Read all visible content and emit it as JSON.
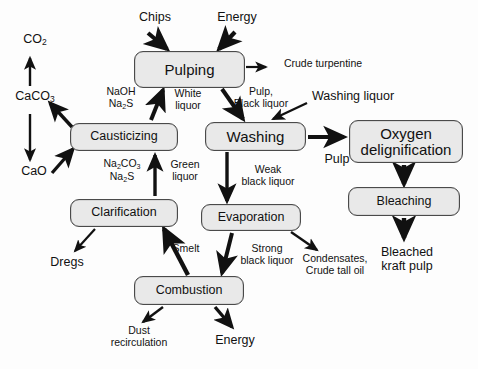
{
  "diagram": {
    "style": {
      "node_fill": "#e9e9e9",
      "node_border": "#4a4a4a",
      "arrow_color": "#111111",
      "background": "#fdfdfd"
    },
    "nodes": [
      {
        "id": "pulping",
        "label": "Pulping",
        "x": 134,
        "y": 51,
        "w": 111,
        "h": 37,
        "font": "big"
      },
      {
        "id": "causticizing",
        "label": "Causticizing",
        "x": 70,
        "y": 123,
        "w": 108,
        "h": 28,
        "font": "mid"
      },
      {
        "id": "washing",
        "label": "Washing",
        "x": 205,
        "y": 122,
        "w": 101,
        "h": 29,
        "font": "big"
      },
      {
        "id": "oxygen",
        "label": "Oxygen\ndelignification",
        "x": 349,
        "y": 120,
        "w": 114,
        "h": 43,
        "font": "big"
      },
      {
        "id": "clarification",
        "label": "Clarification",
        "x": 70,
        "y": 199,
        "w": 108,
        "h": 28,
        "font": "mid"
      },
      {
        "id": "evaporation",
        "label": "Evaporation",
        "x": 201,
        "y": 204,
        "w": 100,
        "h": 27,
        "font": "mid"
      },
      {
        "id": "bleaching",
        "label": "Bleaching",
        "x": 348,
        "y": 187,
        "w": 112,
        "h": 29,
        "font": "mid"
      },
      {
        "id": "combustion",
        "label": "Combustion",
        "x": 134,
        "y": 276,
        "w": 110,
        "h": 29,
        "font": "mid"
      }
    ],
    "labels": [
      {
        "id": "chips",
        "text": "Chips",
        "x": 127,
        "y": 10,
        "w": 56,
        "font": "mid"
      },
      {
        "id": "energy-top",
        "text": "Energy",
        "x": 206,
        "y": 10,
        "w": 62,
        "font": "mid"
      },
      {
        "id": "co2",
        "text": "CO₂",
        "x": 10,
        "y": 32,
        "w": 50,
        "font": "mid"
      },
      {
        "id": "caco3",
        "text": "CaCO₃",
        "x": 3,
        "y": 89,
        "w": 64,
        "font": "mid"
      },
      {
        "id": "cao",
        "text": "CaO",
        "x": 9,
        "y": 164,
        "w": 50,
        "font": "mid"
      },
      {
        "id": "crude-turpentine",
        "text": "Crude turpentine",
        "x": 271,
        "y": 58,
        "w": 104,
        "font": "sm"
      },
      {
        "id": "naoh-na2s",
        "text": "NaOH\nNa₂S",
        "x": 97,
        "y": 86,
        "w": 48,
        "font": "sm"
      },
      {
        "id": "white-liquor",
        "text": "White\nliquor",
        "x": 167,
        "y": 88,
        "w": 42,
        "font": "sm"
      },
      {
        "id": "pulp-black-liquor",
        "text": "Pulp,\nBlack liquor",
        "x": 226,
        "y": 86,
        "w": 70,
        "font": "sm"
      },
      {
        "id": "washing-liquor",
        "text": "Washing liquor",
        "x": 307,
        "y": 89,
        "w": 92,
        "font": "mid"
      },
      {
        "id": "na2co3-na2s",
        "text": "Na₂CO₃\nNa₂S",
        "x": 95,
        "y": 158,
        "w": 54,
        "font": "sm"
      },
      {
        "id": "green-liquor",
        "text": "Green\nliquor",
        "x": 163,
        "y": 159,
        "w": 44,
        "font": "sm"
      },
      {
        "id": "weak-black-liquor",
        "text": "Weak\nblack liquor",
        "x": 232,
        "y": 164,
        "w": 72,
        "font": "sm"
      },
      {
        "id": "pulp",
        "text": "Pulp",
        "x": 316,
        "y": 152,
        "w": 42,
        "font": "mid"
      },
      {
        "id": "dregs",
        "text": "Dregs",
        "x": 43,
        "y": 255,
        "w": 48,
        "font": "mid"
      },
      {
        "id": "smelt",
        "text": "Smelt",
        "x": 165,
        "y": 243,
        "w": 42,
        "font": "sm"
      },
      {
        "id": "strong-black-liquor",
        "text": "Strong\nblack liquor",
        "x": 231,
        "y": 243,
        "w": 72,
        "font": "sm"
      },
      {
        "id": "condensates",
        "text": "Condensates,\nCrude tall oil",
        "x": 293,
        "y": 253,
        "w": 84,
        "font": "sm"
      },
      {
        "id": "bleached-kraft-pulp",
        "text": "Bleached\nkraft pulp",
        "x": 367,
        "y": 245,
        "w": 80,
        "font": "mid"
      },
      {
        "id": "dust-recirculation",
        "text": "Dust\nrecirculation",
        "x": 97,
        "y": 325,
        "w": 84,
        "font": "sm"
      },
      {
        "id": "energy-bottom",
        "text": "Energy",
        "x": 204,
        "y": 333,
        "w": 62,
        "font": "mid"
      }
    ],
    "flows": [
      {
        "id": "chips-to-pulping",
        "from": "Chips",
        "to": "Pulping"
      },
      {
        "id": "energy-to-pulping",
        "from": "Energy",
        "to": "Pulping"
      },
      {
        "id": "pulping-to-crude-turpentine",
        "from": "Pulping",
        "to": "Crude turpentine"
      },
      {
        "id": "pulping-to-washing",
        "from": "Pulping",
        "to": "Washing",
        "label": "Pulp, Black liquor"
      },
      {
        "id": "causticizing-to-pulping",
        "from": "Causticizing",
        "to": "Pulping",
        "label": "White liquor / NaOH, Na2S"
      },
      {
        "id": "causticizing-to-caco3",
        "from": "Causticizing",
        "to": "CaCO₃"
      },
      {
        "id": "cao-to-causticizing",
        "from": "CaO",
        "to": "Causticizing"
      },
      {
        "id": "caco3-to-co2",
        "from": "CaCO₃",
        "to": "CO₂"
      },
      {
        "id": "caco3-to-cao",
        "from": "CaCO₃",
        "to": "CaO"
      },
      {
        "id": "clarification-to-causticizing",
        "from": "Clarification",
        "to": "Causticizing",
        "label": "Green liquor / Na2CO3, Na2S"
      },
      {
        "id": "clarification-to-dregs",
        "from": "Clarification",
        "to": "Dregs"
      },
      {
        "id": "washing-liquor-to-washing",
        "from": "Washing liquor",
        "to": "Washing"
      },
      {
        "id": "washing-to-oxygen",
        "from": "Washing",
        "to": "Oxygen delignification",
        "label": "Pulp"
      },
      {
        "id": "washing-to-evaporation",
        "from": "Washing",
        "to": "Evaporation",
        "label": "Weak black liquor"
      },
      {
        "id": "oxygen-to-bleaching",
        "from": "Oxygen delignification",
        "to": "Bleaching"
      },
      {
        "id": "bleaching-to-bleached-pulp",
        "from": "Bleaching",
        "to": "Bleached kraft pulp"
      },
      {
        "id": "evaporation-to-combustion",
        "from": "Evaporation",
        "to": "Combustion",
        "label": "Strong black liquor"
      },
      {
        "id": "evaporation-to-condensates",
        "from": "Evaporation",
        "to": "Condensates, Crude tall oil"
      },
      {
        "id": "combustion-to-clarification",
        "from": "Combustion",
        "to": "Clarification",
        "label": "Smelt"
      },
      {
        "id": "combustion-to-dust",
        "from": "Combustion",
        "to": "Dust recirculation"
      },
      {
        "id": "combustion-to-energy",
        "from": "Combustion",
        "to": "Energy"
      }
    ]
  }
}
